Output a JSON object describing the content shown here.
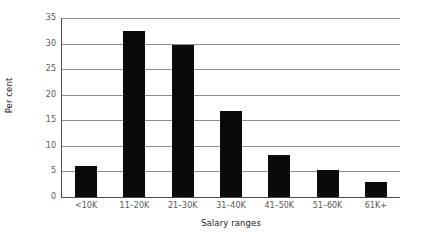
{
  "chart_data": {
    "type": "bar",
    "title": "",
    "xlabel": "Salary ranges",
    "ylabel": "Per cent",
    "categories": [
      "<10K",
      "11–20K",
      "21–30K",
      "31–40K",
      "41–50K",
      "51–60K",
      "61K+"
    ],
    "values": [
      6.0,
      32.5,
      29.7,
      16.8,
      8.2,
      5.2,
      2.9
    ],
    "ylim": [
      0,
      35
    ],
    "ytick_labels": [
      "35",
      "30",
      "25",
      "20",
      "15",
      "10",
      "5",
      "0"
    ],
    "ytick_values": [
      35,
      30,
      25,
      20,
      15,
      10,
      5,
      0
    ],
    "ytick_step": 5,
    "grid": true,
    "grid_axis": "y",
    "legend": false,
    "legend_position": "none",
    "bar_color": "#0a0a0a",
    "grid_color": "#8f8f8f",
    "axis_color": "#4d4d4d",
    "tick_label_color": "#58595b",
    "axis_title_color": "#1a1a1a",
    "background_color": "#ffffff"
  }
}
